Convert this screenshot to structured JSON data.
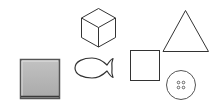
{
  "scene": {
    "background": "#ffffff",
    "stroke_color": "#333333",
    "shapes": [
      {
        "id": "gray-square",
        "type": "filled-square",
        "fill": "#b3b3b3",
        "border": "#4d4d4d"
      },
      {
        "id": "cube",
        "type": "cube-outline"
      },
      {
        "id": "fish",
        "type": "fish-outline"
      },
      {
        "id": "square",
        "type": "square-outline"
      },
      {
        "id": "triangle",
        "type": "triangle-outline"
      },
      {
        "id": "button",
        "type": "button-outline",
        "holes": 4
      }
    ]
  }
}
